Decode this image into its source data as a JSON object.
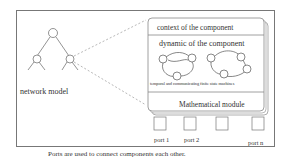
{
  "diagram": {
    "network_label": "network model",
    "component": {
      "context_label": "context of the component",
      "dynamic_label": "dynamic of the component",
      "fsm_label": "temporal and communicating finite state machines",
      "math_label": "Mathematical module"
    },
    "ports": [
      {
        "label": "port 1"
      },
      {
        "label": "port 2"
      },
      {
        "label": ""
      },
      {
        "label": "port n"
      }
    ],
    "caption": "Ports are used to connect components each other."
  }
}
